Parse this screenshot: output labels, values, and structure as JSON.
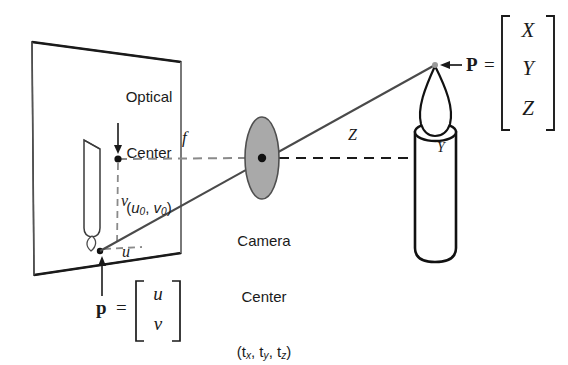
{
  "figure": {
    "labels": {
      "optical_center_line1": "Optical",
      "optical_center_line2": "Center",
      "optical_center_coords_open": "(",
      "optical_center_coords_u": "u",
      "optical_center_coords_u_sub": "0",
      "optical_center_coords_comma": ", ",
      "optical_center_coords_v": "v",
      "optical_center_coords_v_sub": "0",
      "optical_center_coords_close": ")",
      "camera_center_line1": "Camera",
      "camera_center_line2": "Center",
      "camera_center_coords_open": "(t",
      "camera_center_sub_x": "x",
      "camera_center_sep1": ", t",
      "camera_center_sub_y": "y",
      "camera_center_sep2": ", t",
      "camera_center_sub_z": "z",
      "camera_center_close": ")",
      "focal_length": "f",
      "depth": "Z",
      "height_world": "Y",
      "image_v": "v",
      "image_u": "u",
      "point_image_name": "p",
      "point_image_equals": "=",
      "point_image_row1": "u",
      "point_image_row2": "v",
      "point_world_name": "P",
      "point_world_equals": "=",
      "point_world_row1": "X",
      "point_world_row2": "Y",
      "point_world_row3": "Z"
    },
    "colors": {
      "stroke_dark": "#1a1a1a",
      "stroke_gray": "#555555",
      "plane_edge": "#3a3a3a",
      "dashed_gray": "#8a8a8a",
      "lens_fill": "#a9a9a9",
      "lens_stroke": "#4a4a4a",
      "ray_color": "#4a4a4a",
      "background": "#ffffff"
    },
    "geometry": {
      "image_plane_corners": [
        [
          32,
          42
        ],
        [
          181,
          62
        ],
        [
          181,
          253
        ],
        [
          34,
          275
        ]
      ],
      "optical_center_point": [
        118,
        159
      ],
      "camera_center_point": [
        262,
        158
      ],
      "lens_ellipse": {
        "cx": 262,
        "cy": 158,
        "rx": 17,
        "ry": 41
      },
      "image_point_p": [
        100,
        251
      ],
      "world_point_P": [
        435,
        65
      ],
      "candle_body": {
        "x": 415,
        "y": 132,
        "w": 41,
        "h": 128
      },
      "optical_axis_y": 158
    }
  }
}
